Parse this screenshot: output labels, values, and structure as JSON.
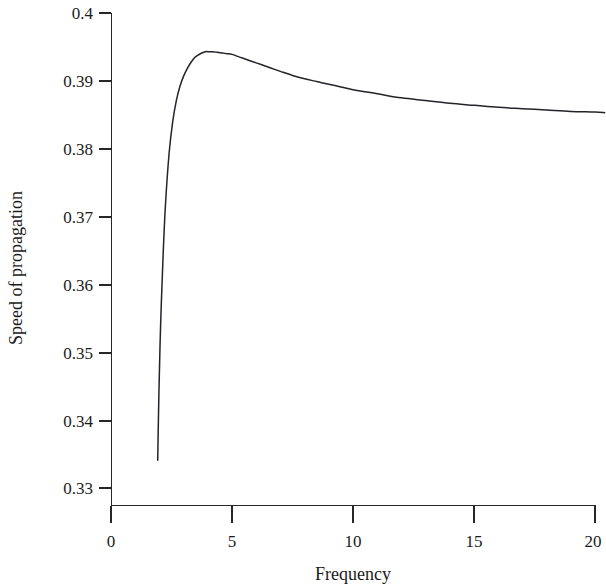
{
  "chart_data": {
    "type": "line",
    "title": "",
    "xlabel": "Frequency",
    "ylabel": "Speed of propagation",
    "xlim": [
      0,
      20
    ],
    "ylim": [
      0.33,
      0.4
    ],
    "grid": false,
    "legend": null,
    "x_ticks": [
      0,
      5,
      10,
      15,
      20
    ],
    "x_tick_labels": [
      "0",
      "5",
      "10",
      "15",
      "20"
    ],
    "y_ticks": [
      0.33,
      0.34,
      0.35,
      0.36,
      0.37,
      0.38,
      0.39,
      0.4
    ],
    "y_tick_labels": [
      "0.33",
      "0.34",
      "0.35",
      "0.36",
      "0.37",
      "0.38",
      "0.39",
      "0.4"
    ],
    "series": [
      {
        "name": "speed of propagation",
        "color": "#23232a",
        "x": [
          1.93,
          1.98,
          2.05,
          2.15,
          2.25,
          2.4,
          2.55,
          2.7,
          2.85,
          3.0,
          3.15,
          3.3,
          3.45,
          3.6,
          3.75,
          3.9,
          4.05,
          4.2,
          4.4,
          4.6,
          4.8,
          5.0,
          5.4,
          5.8,
          6.2,
          6.6,
          7.0,
          7.5,
          8.0,
          8.5,
          9.0,
          9.5,
          10.0,
          11.0,
          12.0,
          13.0,
          14.0,
          15.0,
          16.0,
          17.0,
          18.0,
          19.0,
          20.0,
          20.4
        ],
        "y": [
          0.3341,
          0.344,
          0.354,
          0.364,
          0.3717,
          0.3793,
          0.384,
          0.3871,
          0.3892,
          0.3907,
          0.3918,
          0.3927,
          0.3934,
          0.3938,
          0.3941,
          0.3943,
          0.3943,
          0.3943,
          0.3942,
          0.3941,
          0.394,
          0.3939,
          0.3934,
          0.3929,
          0.3924,
          0.3919,
          0.3914,
          0.3908,
          0.3903,
          0.3899,
          0.3895,
          0.3891,
          0.3887,
          0.3881,
          0.3875,
          0.3871,
          0.3867,
          0.3864,
          0.3861,
          0.3859,
          0.3857,
          0.3855,
          0.3854,
          0.3853
        ]
      }
    ],
    "annotations": {
      "peak_x": 4.2,
      "peak_y": 0.3943,
      "start_x": 1.93,
      "start_y": 0.3341,
      "end_x": 20.4,
      "end_y": 0.3853
    }
  },
  "axes": {
    "x_axis_name": "frequency-axis",
    "y_axis_name": "speed-axis"
  }
}
